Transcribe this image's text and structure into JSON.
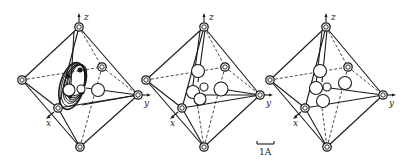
{
  "figure": {
    "panels": [
      {
        "id": "panel-1",
        "axes": {
          "z": "z",
          "y": "y",
          "x": "x"
        },
        "content": "torus of overlapping rings (delocalized positions) with central atoms"
      },
      {
        "id": "panel-2",
        "axes": {
          "z": "z",
          "y": "y",
          "x": "x"
        },
        "content": "cluster of five discrete atoms"
      },
      {
        "id": "panel-3",
        "axes": {
          "z": "z",
          "y": "y",
          "x": "x"
        },
        "content": "cluster of five discrete atoms, alternate arrangement"
      }
    ],
    "scale_bar": {
      "label": "1A"
    }
  }
}
